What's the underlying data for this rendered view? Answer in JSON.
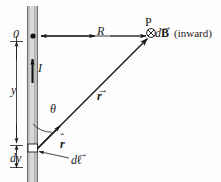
{
  "figure": {
    "background_color": "#fdfdfd",
    "ink_color": "#1a1a1a",
    "wire_color": "#b9b9b9",
    "wire_edge_color": "#8f8f8f",
    "width": 221,
    "height": 182
  },
  "labels": {
    "origin": "0",
    "distance_R": "R",
    "point_P": "P",
    "dB_d": "d",
    "dB_B": "B",
    "dB_inward": "(inward)",
    "current_I": "I",
    "height_y": "y",
    "angle_theta": "θ",
    "r_vector_r": "r",
    "r_hat_r": "r",
    "dl_d": "d",
    "dl_l": "ℓ",
    "element_dy": "dy",
    "vector_accent": "→",
    "hat_accent": "ˆ"
  },
  "geometry": {
    "wire_x_left": 27,
    "wire_x_right": 38,
    "wire_top": 6,
    "wire_bottom": 182,
    "origin_point": {
      "x": 33,
      "y": 36
    },
    "point_P": {
      "x": 151,
      "y": 33
    },
    "source_point": {
      "x": 33,
      "y": 151
    },
    "R_arrow": {
      "x1": 40,
      "y1": 36,
      "x2": 146,
      "y2": 36
    },
    "r_vector": {
      "x1": 36,
      "y1": 149,
      "x2": 146,
      "y2": 38
    },
    "current_arrow": {
      "x": 32,
      "y1": 82,
      "y2": 58
    },
    "y_dimension": {
      "x": 16,
      "y1": 40,
      "y2": 144
    },
    "dy_dimension": {
      "x": 16,
      "y1": 144,
      "y2": 166
    },
    "theta_arc_radius": 26
  }
}
